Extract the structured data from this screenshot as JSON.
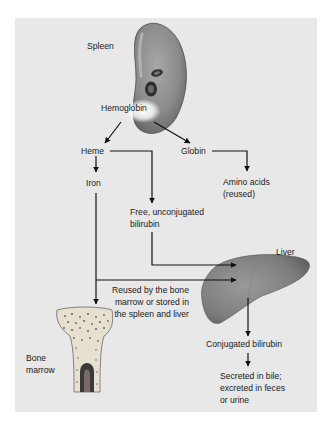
{
  "diagram": {
    "nodes": {
      "spleen": "Spleen",
      "hemoglobin": "Hemoglobin",
      "heme": "Heme",
      "globin": "Globin",
      "iron": "Iron",
      "amino_acids": "Amino acids\n(reused)",
      "free_bilirubin": "Free, unconjugated\nbilirubin",
      "liver": "Liver",
      "reused": "Reused by the bone\nmarrow or stored in\nthe spleen and liver",
      "bone_marrow": "Bone\nmarrow",
      "conjugated_bilirubin": "Conjugated bilirubin",
      "secreted": "Secreted in bile;\nexcreted in feces\nor urine"
    },
    "edges": [
      {
        "from": "Hemoglobin",
        "to": "Heme"
      },
      {
        "from": "Hemoglobin",
        "to": "Globin"
      },
      {
        "from": "Globin",
        "to": "Amino acids (reused)"
      },
      {
        "from": "Heme",
        "to": "Iron"
      },
      {
        "from": "Heme",
        "to": "Free, unconjugated bilirubin"
      },
      {
        "from": "Free, unconjugated bilirubin",
        "to": "Liver"
      },
      {
        "from": "Iron",
        "to": "Liver",
        "label": "Reused by the bone marrow or stored in the spleen and liver"
      },
      {
        "from": "Iron",
        "to": "Bone marrow"
      },
      {
        "from": "Liver",
        "to": "Conjugated bilirubin"
      },
      {
        "from": "Conjugated bilirubin",
        "to": "Secreted in bile; excreted in feces or urine"
      }
    ],
    "colors": {
      "panel": "#e8e8e8",
      "organ": "#7a7a7a",
      "arrow": "#111111"
    }
  }
}
